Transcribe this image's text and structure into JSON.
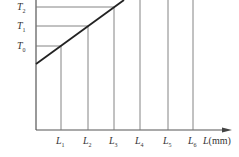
{
  "diagram": {
    "type": "line-with-projections",
    "y_labels": [
      {
        "base": "T",
        "sub": "2",
        "y": 7
      },
      {
        "base": "T",
        "sub": "1",
        "y": 26
      },
      {
        "base": "T",
        "sub": "0",
        "y": 46
      }
    ],
    "x_labels": [
      {
        "base": "L",
        "sub": "1",
        "x": 61
      },
      {
        "base": "L",
        "sub": "2",
        "x": 88
      },
      {
        "base": "L",
        "sub": "3",
        "x": 114
      },
      {
        "base": "L",
        "sub": "4",
        "x": 140
      },
      {
        "base": "L",
        "sub": "5",
        "x": 168
      },
      {
        "base": "L",
        "sub": "6",
        "x": 193
      }
    ],
    "x_axis_label": "L",
    "x_axis_unit": "(mm)",
    "colors": {
      "axis": "#555555",
      "line": "#222222",
      "grid": "#777777"
    }
  }
}
